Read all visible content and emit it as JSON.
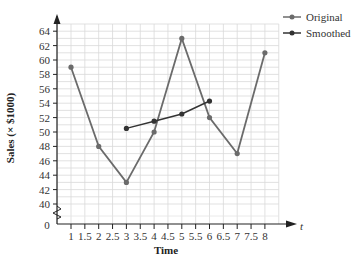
{
  "chart_data": {
    "type": "line",
    "title": "",
    "xlabel": "Time",
    "ylabel": "Sales (× $1000)",
    "x_axis_variable": "t",
    "origin_label": "0",
    "xlim": [
      0,
      8.5
    ],
    "ylim": [
      40,
      64
    ],
    "y_axis_break": true,
    "grid": true,
    "legend_position": "upper right, outside",
    "x_ticks": [
      "1",
      "1.5",
      "2",
      "2.5",
      "3",
      "3.5",
      "4",
      "4.5",
      "5",
      "5.5",
      "6",
      "6.5",
      "7",
      "7.5",
      "8"
    ],
    "y_ticks": [
      "40",
      "42",
      "44",
      "46",
      "48",
      "50",
      "52",
      "54",
      "56",
      "58",
      "60",
      "62",
      "64"
    ],
    "series": [
      {
        "name": "Original",
        "color": "#6b6b6b",
        "x": [
          1,
          2,
          3,
          4,
          5,
          6,
          7,
          8
        ],
        "values": [
          59,
          48,
          43,
          50,
          63,
          52,
          47,
          61
        ]
      },
      {
        "name": "Smoothed",
        "color": "#333333",
        "x": [
          3,
          4,
          5,
          6
        ],
        "values": [
          50.5,
          51.5,
          52.5,
          54.3
        ]
      }
    ]
  },
  "legend": {
    "items": [
      {
        "label": "Original",
        "color": "#6b6b6b"
      },
      {
        "label": "Smoothed",
        "color": "#333333"
      }
    ]
  }
}
